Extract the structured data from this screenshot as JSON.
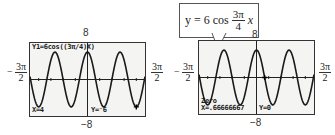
{
  "left_graph": {
    "window": {
      "ymax_label": "8",
      "ymin_label": "−8",
      "xmin_label": {
        "sign": "−",
        "num": "3π",
        "den": "2"
      },
      "xmax_label": {
        "num": "3π",
        "den": "2"
      }
    },
    "equation_line": "Y1=6cos((3π/4)X)",
    "trace_x": "X=4",
    "trace_y": "Y=⁻6"
  },
  "right_graph": {
    "window": {
      "ymax_label": "8",
      "ymin_label": "−8",
      "xmin_label": {
        "sign": "−",
        "num": "3π",
        "den": "2"
      },
      "xmax_label": {
        "num": "3π",
        "den": "2"
      }
    },
    "callout": {
      "lhs": "y = 6 cos",
      "frac_num": "3π",
      "frac_den": "4",
      "var": "x"
    },
    "mode_label": "Zero",
    "result_x": "X=.66666667",
    "result_y": "Y=0"
  },
  "function": {
    "amplitude": 6,
    "angular_freq": "3π/4",
    "x_range": [
      -4.712,
      4.712
    ],
    "y_range": [
      -8,
      8
    ]
  }
}
